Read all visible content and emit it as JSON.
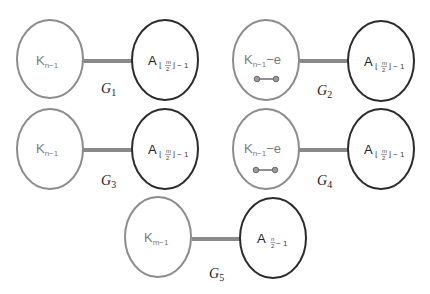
{
  "graphs": [
    {
      "id": "G1",
      "label": {
        "main": "G",
        "sub": "1"
      },
      "left": {
        "base": "K",
        "sub": "n−1",
        "suffix": "",
        "has_mini_edge": false
      },
      "right": {
        "base": "A",
        "sub_prefix": "⌊",
        "frac_num": "m",
        "frac_den": "2",
        "sub_suffix": "⌋ − 1"
      }
    },
    {
      "id": "G2",
      "label": {
        "main": "G",
        "sub": "2"
      },
      "left": {
        "base": "K",
        "sub": "n−1",
        "suffix": "−e",
        "has_mini_edge": true
      },
      "right": {
        "base": "A",
        "sub_prefix": "⌊",
        "frac_num": "m",
        "frac_den": "2",
        "sub_suffix": "⌋ − 1"
      }
    },
    {
      "id": "G3",
      "label": {
        "main": "G",
        "sub": "3"
      },
      "left": {
        "base": "K",
        "sub": "n−1",
        "suffix": "",
        "has_mini_edge": false
      },
      "right": {
        "base": "A",
        "sub_prefix": "⌊",
        "frac_num": "m",
        "frac_den": "2",
        "sub_suffix": "⌋ − 1"
      }
    },
    {
      "id": "G4",
      "label": {
        "main": "G",
        "sub": "4"
      },
      "left": {
        "base": "K",
        "sub": "n−1",
        "suffix": "−e",
        "has_mini_edge": true
      },
      "right": {
        "base": "A",
        "sub_prefix": "⌊",
        "frac_num": "m",
        "frac_den": "2",
        "sub_suffix": "⌋ − 1"
      }
    },
    {
      "id": "G5",
      "label": {
        "main": "G",
        "sub": "5"
      },
      "left": {
        "base": "K",
        "sub": "m−1",
        "suffix": "",
        "has_mini_edge": false
      },
      "right": {
        "base": "A",
        "sub_prefix": "",
        "frac_num": "n",
        "frac_den": "2",
        "sub_suffix": " − 1"
      }
    }
  ],
  "colors": {
    "k_stroke": "#8c8c8c",
    "a_stroke": "#2b2b2b",
    "edge": "#8a8a8a",
    "background": "#ffffff"
  }
}
